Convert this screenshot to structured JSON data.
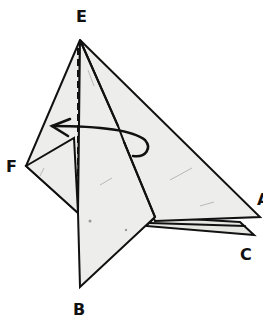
{
  "diagram": {
    "type": "origami-fold-step",
    "labels": {
      "E": "E",
      "F": "F",
      "A": "A",
      "B": "B",
      "C": "C"
    },
    "annotations": {
      "fold_line": "valley-fold (dashed) from E toward B",
      "arrow": "curved arrow indicating fold the flap to the left, behind"
    },
    "colors": {
      "paper": "#ededeb",
      "outline": "#111111",
      "background": "#ffffff"
    }
  }
}
